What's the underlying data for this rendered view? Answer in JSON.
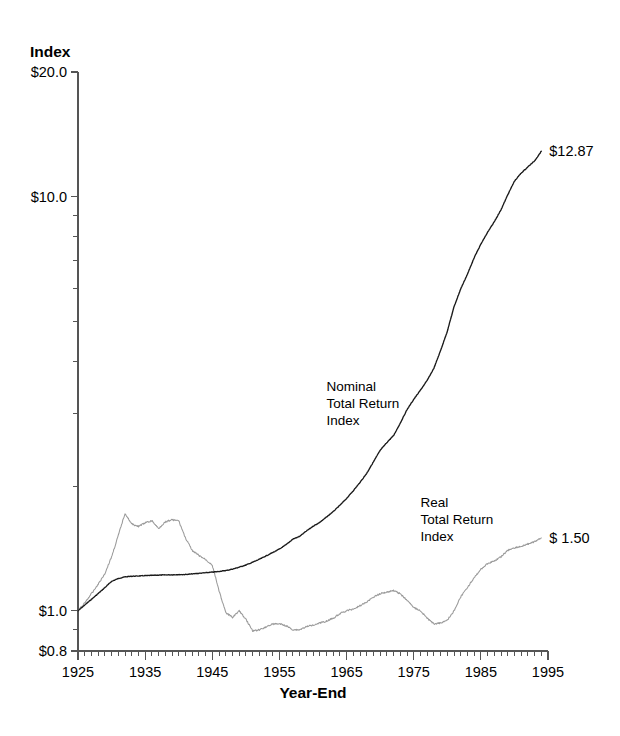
{
  "chart_data": {
    "type": "line",
    "title": "",
    "ylabel": "Index",
    "xlabel": "Year-End",
    "yscale": "log",
    "ylim": [
      0.8,
      20.0
    ],
    "xlim": [
      1925,
      1995
    ],
    "grid": false,
    "legend": "inline-annotations",
    "ytick_labels": [
      "$20.0",
      "$10.0",
      "$1.0",
      "$0.8"
    ],
    "ytick_values": [
      20.0,
      10.0,
      1.0,
      0.8
    ],
    "yminor_values": [
      9,
      8,
      7,
      6,
      5,
      4,
      3,
      2,
      0.9
    ],
    "xtick_labels": [
      "1925",
      "1935",
      "1945",
      "1955",
      "1965",
      "1975",
      "1985",
      "1995"
    ],
    "xtick_values": [
      1925,
      1935,
      1945,
      1955,
      1965,
      1975,
      1985,
      1995
    ],
    "x_minor_interval": 1,
    "annotations": [
      {
        "name": "nominal-annotation",
        "lines": [
          "Nominal",
          "Total Return",
          "Index"
        ],
        "x": 1962,
        "y": 3.4
      },
      {
        "name": "real-annotation",
        "lines": [
          "Real",
          "Total Return",
          "Index"
        ],
        "x": 1976,
        "y": 1.78
      },
      {
        "name": "nominal-end-value",
        "text": "$12.87",
        "x": 1994,
        "y": 12.87
      },
      {
        "name": "real-end-value",
        "text": "$ 1.50",
        "x": 1994,
        "y": 1.5
      }
    ],
    "series": [
      {
        "name": "Nominal Total Return Index",
        "color": "#1a1a1a",
        "end_value": 12.87,
        "x": [
          1925,
          1926,
          1927,
          1928,
          1929,
          1930,
          1931,
          1932,
          1933,
          1934,
          1935,
          1936,
          1937,
          1938,
          1939,
          1940,
          1941,
          1942,
          1943,
          1944,
          1945,
          1946,
          1947,
          1948,
          1949,
          1950,
          1951,
          1952,
          1953,
          1954,
          1955,
          1956,
          1957,
          1958,
          1959,
          1960,
          1961,
          1962,
          1963,
          1964,
          1965,
          1966,
          1967,
          1968,
          1969,
          1970,
          1971,
          1972,
          1973,
          1974,
          1975,
          1976,
          1977,
          1978,
          1979,
          1980,
          1981,
          1982,
          1983,
          1984,
          1985,
          1986,
          1987,
          1988,
          1989,
          1990,
          1991,
          1992,
          1993,
          1994
        ],
        "values": [
          1.0,
          1.033,
          1.066,
          1.101,
          1.138,
          1.178,
          1.197,
          1.208,
          1.212,
          1.214,
          1.216,
          1.218,
          1.22,
          1.221,
          1.222,
          1.223,
          1.224,
          1.228,
          1.232,
          1.236,
          1.24,
          1.245,
          1.251,
          1.261,
          1.275,
          1.29,
          1.31,
          1.332,
          1.357,
          1.383,
          1.41,
          1.445,
          1.49,
          1.513,
          1.558,
          1.6,
          1.635,
          1.684,
          1.736,
          1.798,
          1.868,
          1.95,
          2.042,
          2.148,
          2.29,
          2.44,
          2.55,
          2.65,
          2.84,
          3.06,
          3.24,
          3.41,
          3.6,
          3.85,
          4.25,
          4.73,
          5.42,
          5.99,
          6.5,
          7.12,
          7.68,
          8.2,
          8.7,
          9.3,
          10.1,
          10.9,
          11.4,
          11.8,
          12.2,
          12.87
        ]
      },
      {
        "name": "Real Total Return Index",
        "color": "#9a9a9a",
        "end_value": 1.5,
        "x": [
          1925,
          1926,
          1927,
          1928,
          1929,
          1930,
          1931,
          1932,
          1933,
          1934,
          1935,
          1936,
          1937,
          1938,
          1939,
          1940,
          1941,
          1942,
          1943,
          1944,
          1945,
          1946,
          1947,
          1948,
          1949,
          1950,
          1951,
          1952,
          1953,
          1954,
          1955,
          1956,
          1957,
          1958,
          1959,
          1960,
          1961,
          1962,
          1963,
          1964,
          1965,
          1966,
          1967,
          1968,
          1969,
          1970,
          1971,
          1972,
          1973,
          1974,
          1975,
          1976,
          1977,
          1978,
          1979,
          1980,
          1981,
          1982,
          1983,
          1984,
          1985,
          1986,
          1987,
          1988,
          1989,
          1990,
          1991,
          1992,
          1993,
          1994
        ],
        "values": [
          1.0,
          1.045,
          1.1,
          1.16,
          1.23,
          1.35,
          1.52,
          1.72,
          1.62,
          1.6,
          1.63,
          1.65,
          1.58,
          1.64,
          1.66,
          1.65,
          1.5,
          1.4,
          1.36,
          1.33,
          1.29,
          1.12,
          0.99,
          0.965,
          1.0,
          0.955,
          0.895,
          0.9,
          0.915,
          0.93,
          0.93,
          0.92,
          0.9,
          0.9,
          0.915,
          0.925,
          0.935,
          0.945,
          0.96,
          0.985,
          1.0,
          1.01,
          1.03,
          1.05,
          1.08,
          1.1,
          1.11,
          1.12,
          1.1,
          1.06,
          1.02,
          1.0,
          0.96,
          0.93,
          0.935,
          0.95,
          1.0,
          1.08,
          1.14,
          1.2,
          1.26,
          1.3,
          1.32,
          1.35,
          1.4,
          1.42,
          1.43,
          1.45,
          1.47,
          1.5
        ]
      }
    ]
  }
}
